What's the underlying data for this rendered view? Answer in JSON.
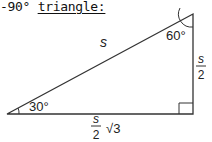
{
  "heading": {
    "prefix": "-90°",
    "underlined": "triangle:"
  },
  "diagram": {
    "type": "30-60-90 right triangle",
    "line_color": "#333333",
    "angles": {
      "bottom_left": "30°",
      "top_right": "60°",
      "bottom_right": "right angle"
    },
    "sides": {
      "hypotenuse": "s",
      "vertical_leg_num": "s",
      "vertical_leg_den": "2",
      "horizontal_leg_num": "s",
      "horizontal_leg_den": "2",
      "horizontal_leg_radical": "√3"
    }
  }
}
